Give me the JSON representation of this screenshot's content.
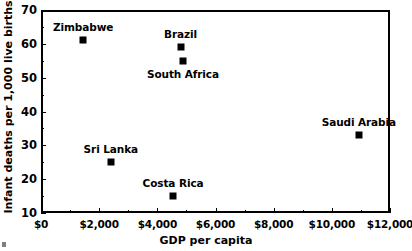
{
  "chart_data": {
    "type": "scatter",
    "title": "",
    "xlabel": "GDP per capita",
    "ylabel": "Infant deaths per 1,000 live births",
    "xlim": [
      0,
      12000
    ],
    "ylim": [
      10,
      70
    ],
    "grid": false,
    "legend": "none",
    "x_tick_labels": [
      "$0",
      "$2,000",
      "$4,000",
      "$6,000",
      "$8,000",
      "$10,000",
      "$12,000"
    ],
    "x_tick_values": [
      0,
      2000,
      4000,
      6000,
      8000,
      10000,
      12000
    ],
    "x_minor_tick_values": [
      1000,
      3000,
      5000,
      7000,
      9000,
      11000
    ],
    "y_tick_labels": [
      "10",
      "20",
      "30",
      "40",
      "50",
      "60",
      "70"
    ],
    "y_tick_values": [
      10,
      20,
      30,
      40,
      50,
      60,
      70
    ],
    "y_minor_tick_values": [
      15,
      25,
      35,
      45,
      55,
      65
    ],
    "marker_color": "#000000",
    "marker_shape": "square",
    "points": [
      {
        "label": "Zimbabwe",
        "x": 1450,
        "y": 61,
        "label_pos": "above"
      },
      {
        "label": "Brazil",
        "x": 4800,
        "y": 59,
        "label_pos": "above"
      },
      {
        "label": "South Africa",
        "x": 4880,
        "y": 55,
        "label_pos": "below"
      },
      {
        "label": "Sri Lanka",
        "x": 2400,
        "y": 25,
        "label_pos": "above"
      },
      {
        "label": "Costa Rica",
        "x": 4540,
        "y": 15,
        "label_pos": "above"
      },
      {
        "label": "Saudi Arabia",
        "x": 10930,
        "y": 33,
        "label_pos": "above"
      }
    ]
  }
}
